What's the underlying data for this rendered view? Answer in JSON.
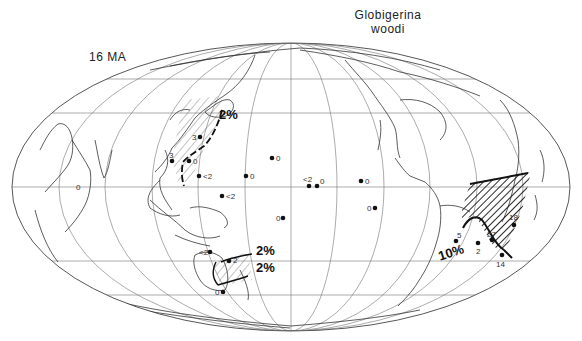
{
  "map": {
    "title_line1": "Globigerina",
    "title_line2": "woodi",
    "age_label": "16 MA",
    "projection": "mollweide-like world outline (Pacific centered)",
    "colors": {
      "ink": "#1a1a1a",
      "graticule": "#555555",
      "coast": "#333333",
      "background": "#ffffff"
    },
    "contours": [
      {
        "id": "nw-pacific",
        "label": "2%"
      },
      {
        "id": "sw-pacific-upper",
        "label": "2%"
      },
      {
        "id": "sw-pacific-lower",
        "label": "2%"
      },
      {
        "id": "south-atlantic",
        "label": "10%"
      }
    ],
    "sites": [
      {
        "region": "NW Pacific",
        "value": "3"
      },
      {
        "region": "NW Pacific",
        "value": "3"
      },
      {
        "region": "NW Pacific",
        "value": "0"
      },
      {
        "region": "W Pacific",
        "value": "<2"
      },
      {
        "region": "Central Pacific",
        "value": "0"
      },
      {
        "region": "Central Pacific",
        "value": "0"
      },
      {
        "region": "W Pacific",
        "value": "<2"
      },
      {
        "region": "Central Pacific",
        "value": "<2"
      },
      {
        "region": "Central Pacific",
        "value": "0"
      },
      {
        "region": "E Pacific",
        "value": "0"
      },
      {
        "region": "E Pacific",
        "value": "0"
      },
      {
        "region": "S Pacific",
        "value": "0"
      },
      {
        "region": "SW Pacific",
        "value": "<2"
      },
      {
        "region": "SW Pacific",
        "value": "2"
      },
      {
        "region": "SW Pacific",
        "value": "0"
      },
      {
        "region": "South Atlantic",
        "value": "5"
      },
      {
        "region": "South Atlantic",
        "value": "2"
      },
      {
        "region": "South Atlantic",
        "value": "27"
      },
      {
        "region": "South Atlantic",
        "value": "18"
      },
      {
        "region": "South Atlantic",
        "value": "14"
      }
    ],
    "misc_labels": {
      "indian_ocean_zero": "0"
    }
  }
}
